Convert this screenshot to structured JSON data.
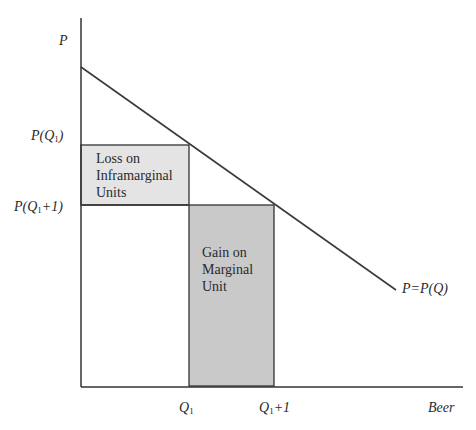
{
  "diagram": {
    "axes": {
      "y_label": "P",
      "x_label": "Beer"
    },
    "y_ticks": [
      {
        "label_main": "P(Q",
        "label_sub": "1",
        "label_tail": ")"
      },
      {
        "label_main": "P(Q",
        "label_sub": "1",
        "label_tail": "+1)"
      }
    ],
    "x_ticks": [
      {
        "label_main": "Q",
        "label_sub": "1",
        "label_tail": ""
      },
      {
        "label_main": "Q",
        "label_sub": "1",
        "label_tail": "+1"
      }
    ],
    "curve_label": "P=P(Q)",
    "regions": {
      "loss": {
        "lines": [
          "Loss on",
          "Inframarginal",
          "Units"
        ],
        "fill": "#e6e6e6"
      },
      "gain": {
        "lines": [
          "Gain on",
          "Marginal",
          "Unit"
        ],
        "fill": "#c8c8c8"
      }
    },
    "colors": {
      "line": "#3a3a3a",
      "loss_fill": "#e6e6e6",
      "gain_fill": "#c8c8c8"
    }
  }
}
